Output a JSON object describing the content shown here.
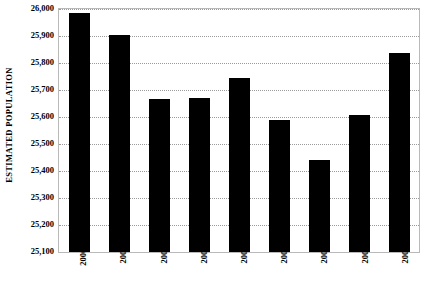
{
  "chart_data": {
    "type": "bar",
    "title": "",
    "xlabel": "",
    "ylabel": "ESTIMATED POPULATION",
    "categories": [
      "2000*",
      "2001",
      "2002",
      "2003",
      "2004",
      "2005",
      "2006",
      "2007",
      "2008"
    ],
    "values": [
      25985,
      25905,
      25665,
      25672,
      25745,
      25588,
      25440,
      25608,
      25838
    ],
    "series": [
      {
        "name": "Estimated Population",
        "values": [
          25985,
          25905,
          25665,
          25672,
          25745,
          25588,
          25440,
          25608,
          25838
        ]
      }
    ],
    "ylim": [
      25100,
      26000
    ],
    "ytick_step": 100,
    "ytick_labels": [
      "26,000",
      "25,900",
      "25,800",
      "25,700",
      "25,600",
      "25,500",
      "25,400",
      "25,300",
      "25,200",
      "25,100"
    ],
    "ytick_values": [
      26000,
      25900,
      25800,
      25700,
      25600,
      25500,
      25400,
      25300,
      25200,
      25100
    ],
    "grid": true,
    "grid_style": "dotted",
    "legend": false,
    "legend_position": "none",
    "bar_color": "#000000",
    "background_color": "#ffffff",
    "gridline_color": "#9a9a9a",
    "axis_color": "#7a7a7a",
    "xtick_rotation": -90,
    "annotations": [
      "* asterisk on 2000 category label"
    ]
  }
}
